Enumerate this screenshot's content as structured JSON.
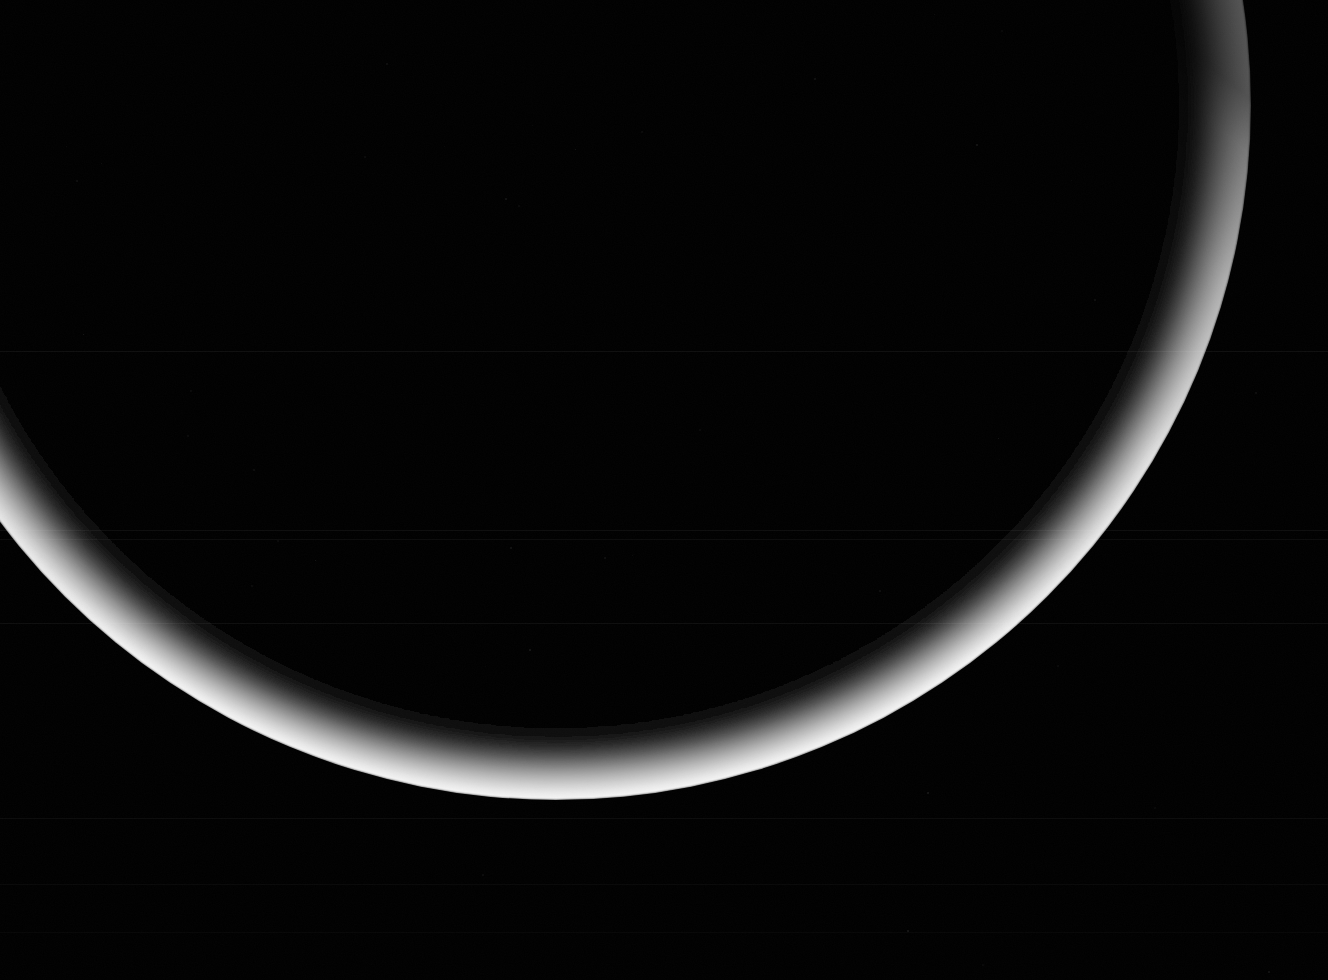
{
  "image": {
    "subject": "crescent-planet-limb",
    "title": "Crescent planet limb against black space",
    "width": 1328,
    "height": 980,
    "background_color": "#000000",
    "alt_text": "A thin bright crescent of a planet sweeping from the left edge down across the bottom and up to the upper right corner, against a black starfield background."
  },
  "crescent": {
    "name": "planet-crescent",
    "limb_circle": {
      "center_x": 556,
      "center_y": 105,
      "radius": 695
    },
    "terminator_ellipse": {
      "center_x": 556,
      "center_y": 105,
      "radius_x": 690,
      "radius_y": 632
    },
    "cusp_left": {
      "x": 0,
      "y": 512
    },
    "cusp_right": {
      "x": 1253,
      "y": 104
    },
    "lowest_limb_point": {
      "x": 556,
      "y": 798
    },
    "max_band_thickness": 64,
    "highlight_color": "#f2f2f2",
    "mid_color": "#b4b4b4",
    "shadow_color": "#000000",
    "limb_edge_softness_px": 3
  },
  "noise": {
    "scanlines": [
      {
        "y": 351,
        "opacity": 0.055
      },
      {
        "y": 530,
        "opacity": 0.05
      },
      {
        "y": 539,
        "opacity": 0.045
      },
      {
        "y": 623,
        "opacity": 0.05
      },
      {
        "y": 818,
        "opacity": 0.045
      },
      {
        "y": 884,
        "opacity": 0.03
      },
      {
        "y": 932,
        "opacity": 0.025
      }
    ],
    "speckle_count": 46,
    "speckle_color": "#2a2a2a"
  },
  "labels": {
    "caption": "",
    "credit": ""
  }
}
